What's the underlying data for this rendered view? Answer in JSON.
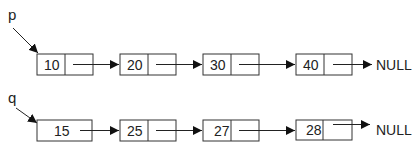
{
  "lists": [
    {
      "pointer": "p",
      "nodes": [
        {
          "value": "10",
          "divided": true
        },
        {
          "value": "20",
          "divided": true
        },
        {
          "value": "30",
          "divided": true
        },
        {
          "value": "40",
          "divided": true
        }
      ],
      "terminal": "NULL"
    },
    {
      "pointer": "q",
      "nodes": [
        {
          "value": "15",
          "divided": false
        },
        {
          "value": "25",
          "divided": true
        },
        {
          "value": "27",
          "divided": true
        },
        {
          "value": "28",
          "divided": true
        }
      ],
      "terminal": "NULL"
    }
  ],
  "colors": {
    "stroke": "#333333",
    "text": "#222222",
    "background": "#ffffff"
  }
}
